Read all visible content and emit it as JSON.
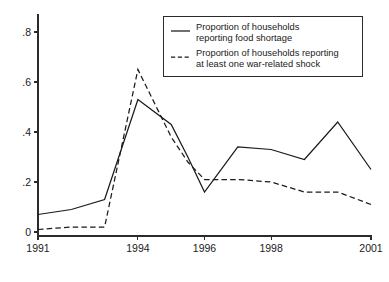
{
  "chart_data": {
    "type": "line",
    "title": "",
    "subtitle": "",
    "xlabel": "",
    "ylabel": "",
    "xlim": [
      1991,
      2001
    ],
    "ylim": [
      0,
      0.88
    ],
    "grid": false,
    "legend_position": "top-right",
    "x": [
      1991,
      1992,
      1993,
      1994,
      1995,
      1996,
      1997,
      1998,
      1999,
      2000,
      2001
    ],
    "xtick_values": [
      1991,
      1994,
      1996,
      1998,
      2001
    ],
    "xtick_labels": [
      "1991",
      "1994",
      "1996",
      "1998",
      "2001"
    ],
    "ytick_values": [
      0,
      0.2,
      0.4,
      0.6,
      0.8
    ],
    "ytick_labels": [
      "0",
      ".2",
      ".4",
      ".6",
      ".8"
    ],
    "series": [
      {
        "name": "Proportion of households reporting food shortage",
        "style": "solid",
        "color": "#1a1a1a",
        "values": [
          0.07,
          0.09,
          0.13,
          0.53,
          0.43,
          0.16,
          0.34,
          0.33,
          0.29,
          0.44,
          0.25
        ],
        "detail_points": [
          [
            1991.0,
            0.07
          ],
          [
            1992.0,
            0.09
          ],
          [
            1993.0,
            0.13
          ],
          [
            1994.0,
            0.53
          ],
          [
            1995.0,
            0.43
          ],
          [
            1995.5,
            0.3
          ],
          [
            1996.0,
            0.16
          ],
          [
            1997.0,
            0.34
          ],
          [
            1998.0,
            0.33
          ],
          [
            1999.0,
            0.29
          ],
          [
            2000.0,
            0.44
          ],
          [
            2001.0,
            0.25
          ]
        ]
      },
      {
        "name": "Proportion of households reporting at least one war-related shock",
        "style": "dashed",
        "color": "#1a1a1a",
        "values": [
          0.01,
          0.02,
          0.02,
          0.65,
          0.44,
          0.21,
          0.21,
          0.2,
          0.16,
          0.16,
          0.11
        ],
        "detail_points": [
          [
            1991.0,
            0.01
          ],
          [
            1992.0,
            0.02
          ],
          [
            1993.0,
            0.02
          ],
          [
            1994.0,
            0.65
          ],
          [
            1995.0,
            0.38
          ],
          [
            1995.5,
            0.28
          ],
          [
            1996.0,
            0.21
          ],
          [
            1997.0,
            0.21
          ],
          [
            1998.0,
            0.2
          ],
          [
            1999.0,
            0.16
          ],
          [
            2000.0,
            0.16
          ],
          [
            2001.0,
            0.11
          ]
        ]
      }
    ]
  },
  "legend": {
    "entries": [
      {
        "sample": "solid-line-sample",
        "line1": "Proportion of households",
        "line2": "reporting food shortage"
      },
      {
        "sample": "dashed-line-sample",
        "line1": "Proportion of households reporting",
        "line2": "at least one war-related shock"
      }
    ]
  },
  "axes": {
    "y_labels": [
      "0",
      ".2",
      ".4",
      ".6",
      ".8"
    ],
    "x_labels": [
      "1991",
      "1994",
      "1996",
      "1998",
      "2001"
    ]
  },
  "colors": {
    "ink": "#1a1a1a",
    "frame": "#2b2b2b",
    "background": "#ffffff"
  }
}
